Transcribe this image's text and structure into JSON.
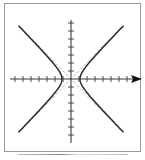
{
  "diagram": {
    "title": "",
    "type": "hyperbola",
    "equation_form": "x^2/a^2 - y^2/b^2 = 1",
    "colors": {
      "frame": "#9a9a9a",
      "curve": "#2a2a2a",
      "axis": "#3a3a3a",
      "asymptote": "#9a9a9a"
    },
    "origin_px": {
      "x": 71,
      "y": 79
    },
    "tick_spacing_px": 8,
    "x_ticks_left": 7,
    "x_ticks_right": 7,
    "y_ticks_up": 7,
    "y_ticks_down": 7,
    "vertex_offset_px": 9,
    "has_x_arrow": true,
    "asymptotes": "dashed lines through origin"
  }
}
